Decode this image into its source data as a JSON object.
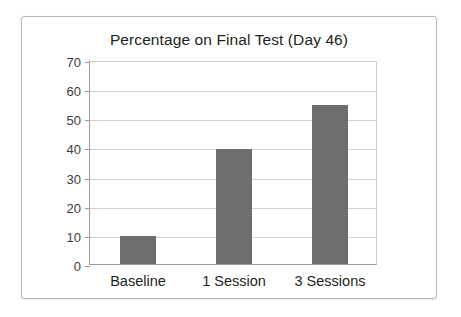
{
  "chart_data": {
    "type": "bar",
    "title": "Percentage on Final Test (Day 46)",
    "categories": [
      "Baseline",
      "1 Session",
      "3 Sessions"
    ],
    "values": [
      9.5,
      39.5,
      54.5
    ],
    "xlabel": "",
    "ylabel": "",
    "ylim": [
      0,
      70
    ],
    "yticks": [
      0,
      10,
      20,
      30,
      40,
      50,
      60,
      70
    ],
    "ytick_labels": [
      "0",
      "10",
      "20",
      "30",
      "40",
      "50",
      "60",
      "70"
    ],
    "grid": "horizontal",
    "legend": "none",
    "bar_color": "#6e6e6e",
    "grid_color": "#d2d2d2",
    "axis_color": "#9a9a9a",
    "title_color": "#231f20",
    "background": "#ffffff"
  }
}
